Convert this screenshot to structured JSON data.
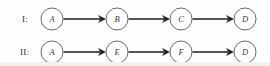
{
  "figure": {
    "width": 270,
    "height": 66,
    "background_color": "#fefefe",
    "node_stroke_color": "#5a5a5a",
    "node_fill_color": "#ffffff",
    "edge_color": "#1d1d1d",
    "label_color": "#2b2b2b",
    "node_text_color": "#3a3a3a",
    "node_radius": 11
  },
  "rows": [
    {
      "id": "row-1",
      "label": "I:",
      "label_x": 22,
      "center_y": 19,
      "nodes": [
        {
          "id": "I-A",
          "label": "A",
          "cx": 52
        },
        {
          "id": "I-B",
          "label": "B",
          "cx": 117
        },
        {
          "id": "I-C",
          "label": "C",
          "cx": 181
        },
        {
          "id": "I-D",
          "label": "D",
          "cx": 245
        }
      ],
      "edges": [
        {
          "from": "A",
          "to": "B"
        },
        {
          "from": "B",
          "to": "C"
        },
        {
          "from": "C",
          "to": "D"
        }
      ]
    },
    {
      "id": "row-2",
      "label": "II:",
      "label_x": 20,
      "center_y": 52,
      "nodes": [
        {
          "id": "II-A",
          "label": "A",
          "cx": 52
        },
        {
          "id": "II-E",
          "label": "E",
          "cx": 117
        },
        {
          "id": "II-F",
          "label": "F",
          "cx": 181
        },
        {
          "id": "II-D",
          "label": "D",
          "cx": 245
        }
      ],
      "edges": [
        {
          "from": "A",
          "to": "E"
        },
        {
          "from": "E",
          "to": "F"
        },
        {
          "from": "F",
          "to": "D"
        }
      ]
    }
  ]
}
